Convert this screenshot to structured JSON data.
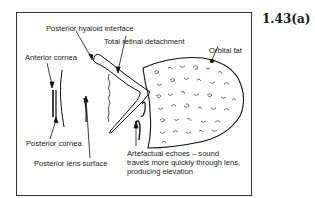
{
  "figure": {
    "number": "1.43(a)",
    "labels": {
      "posterior_hyaloid": "Posterior hyaloid interface",
      "total_retinal_detachment": "Total retinal detachment",
      "anterior_cornea": "Anterior cornea",
      "orbital_fat": "Orbital fat",
      "posterior_cornea": "Posterior cornea",
      "posterior_lens_surface": "Posterior lens surface",
      "artefact_line1": "Artefactual echoes – sound",
      "artefact_line2": "travels more quickly through lens,",
      "artefact_line3": "producing elevation"
    }
  }
}
